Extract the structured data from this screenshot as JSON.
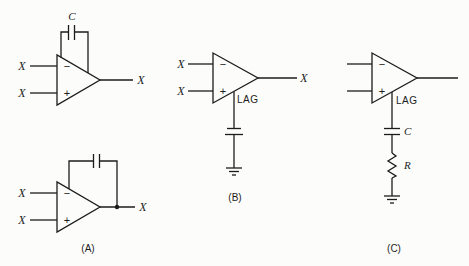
{
  "figure": {
    "background_color": "#fcfcfa",
    "line_color": "#1c1c1c",
    "circuit_a": {
      "top_opamp": {
        "input1_label": "X",
        "input2_label": "X",
        "output_label": "X",
        "minus_sign": "−",
        "plus_sign": "+",
        "feedback_cap_label": "C"
      },
      "bottom_opamp": {
        "input1_label": "X",
        "input2_label": "X",
        "output_label": "X",
        "minus_sign": "−",
        "plus_sign": "+"
      },
      "caption": "(A)"
    },
    "circuit_b": {
      "opamp": {
        "input1_label": "X",
        "input2_label": "X",
        "output_label": "X",
        "minus_sign": "−",
        "plus_sign": "+",
        "mode_label": "LAG"
      },
      "caption": "(B)"
    },
    "circuit_c": {
      "opamp": {
        "minus_sign": "−",
        "plus_sign": "+",
        "mode_label": "LAG"
      },
      "cap_label": "C",
      "resistor_label": "R",
      "caption": "(C)"
    }
  }
}
